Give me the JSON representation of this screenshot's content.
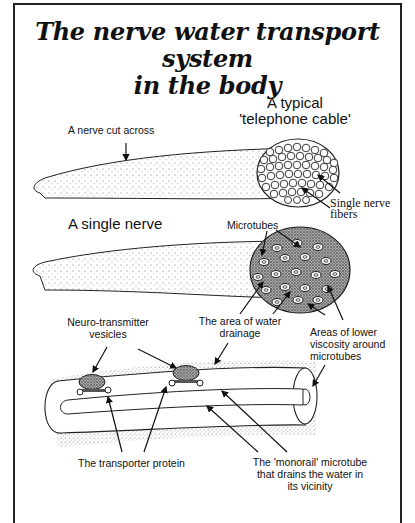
{
  "title": {
    "line1": "The nerve water transport system",
    "line2": "in the body"
  },
  "panel1": {
    "heading_line1": "A typical",
    "heading_line2": "'telephone cable'",
    "label_nerve_cut": "A nerve cut across",
    "label_fibers_line1": "Single nerve",
    "label_fibers_line2": "fibers"
  },
  "panel2": {
    "heading": "A single nerve",
    "label_microtubes": "Microtubes",
    "label_drainage_line1": "The area of water",
    "label_drainage_line2": "drainage",
    "label_viscosity_line1": "Areas of lower",
    "label_viscosity_line2": "viscosity around",
    "label_viscosity_line3": "microtubes"
  },
  "panel3": {
    "label_vesicles_line1": "Neuro-transmitter",
    "label_vesicles_line2": "vesicles",
    "label_transporter": "The transporter protein",
    "label_monorail_line1": "The 'monorail' microtube",
    "label_monorail_line2": "that drains the water in",
    "label_monorail_line3": "its vicinity"
  }
}
